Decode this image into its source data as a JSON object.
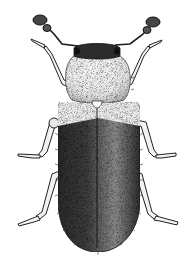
{
  "image": {
    "subject": "beetle illustration",
    "view": "dorsal",
    "style": "stippled black-and-white",
    "width": 192,
    "height": 262
  },
  "colors": {
    "background": "#ffffff",
    "ink": "#1a1a1a",
    "light_stipple": "#e9e9e9",
    "mid": "#9a9a9a",
    "dark": "#3a3a3a"
  }
}
